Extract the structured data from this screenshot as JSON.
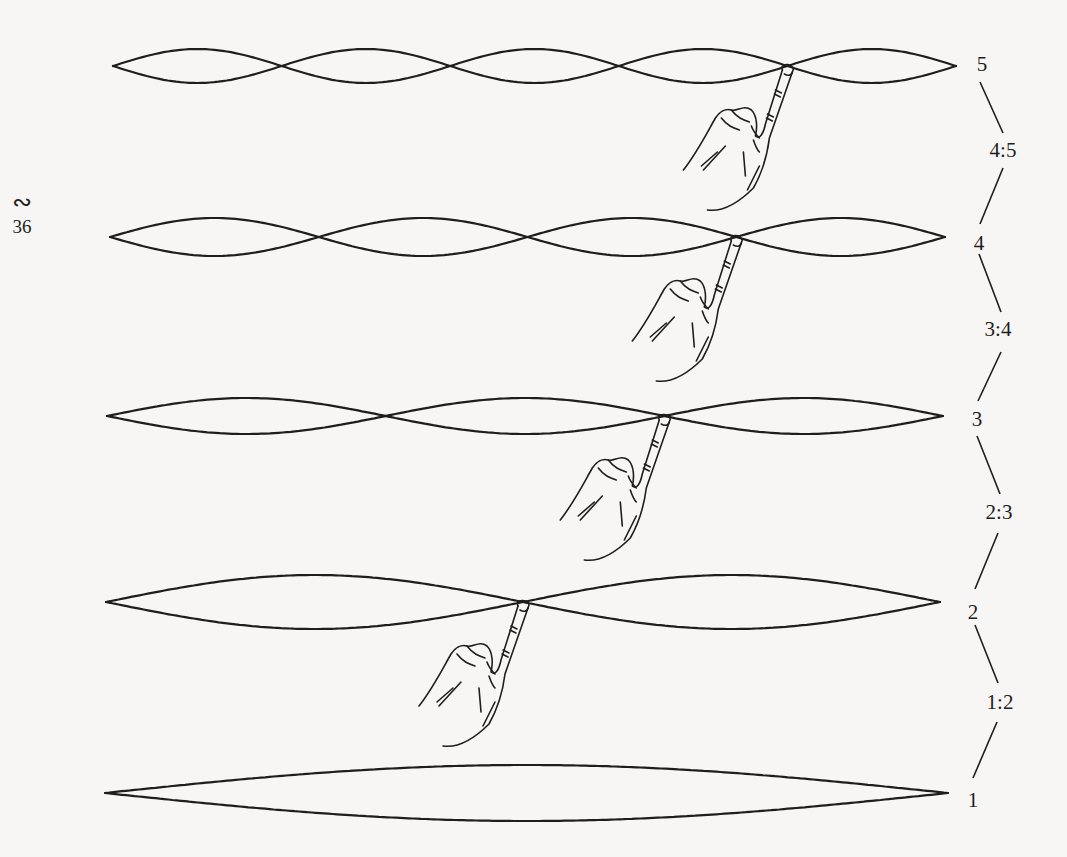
{
  "page": {
    "glyph": "∾",
    "number": "36",
    "background": "#f7f6f4",
    "ink": "#1e1e1e"
  },
  "strings": [
    {
      "harmonic": 5,
      "label": "5",
      "y": 66,
      "x0": 113,
      "x1": 956,
      "amplitude": 17,
      "finger_node": 4
    },
    {
      "harmonic": 4,
      "label": "4",
      "y": 237,
      "x0": 110,
      "x1": 945,
      "amplitude": 19,
      "finger_node": 3
    },
    {
      "harmonic": 3,
      "label": "3",
      "y": 416,
      "x0": 107,
      "x1": 943,
      "amplitude": 18,
      "finger_node": 2
    },
    {
      "harmonic": 2,
      "label": "2",
      "y": 602,
      "x0": 106,
      "x1": 940,
      "amplitude": 27,
      "finger_node": 1
    },
    {
      "harmonic": 1,
      "label": "1",
      "y": 793,
      "x0": 105,
      "x1": 948,
      "amplitude": 28,
      "finger_node": null
    }
  ],
  "ratios": [
    {
      "label": "4:5",
      "x": 1003,
      "y": 150
    },
    {
      "label": "3:4",
      "x": 998,
      "y": 329
    },
    {
      "label": "2:3",
      "x": 999,
      "y": 512
    },
    {
      "label": "1:2",
      "x": 1000,
      "y": 702
    }
  ],
  "number_labels": [
    {
      "label": "5",
      "x": 982,
      "y": 64
    },
    {
      "label": "4",
      "x": 979,
      "y": 243
    },
    {
      "label": "3",
      "x": 977,
      "y": 419
    },
    {
      "label": "2",
      "x": 973,
      "y": 612
    },
    {
      "label": "1",
      "x": 973,
      "y": 800
    }
  ],
  "connectors": [
    [
      980,
      82,
      1003,
      133
    ],
    [
      1003,
      168,
      980,
      224
    ],
    [
      979,
      254,
      1001,
      312
    ],
    [
      1001,
      352,
      978,
      401
    ],
    [
      977,
      436,
      1000,
      494
    ],
    [
      998,
      533,
      975,
      589
    ],
    [
      975,
      625,
      998,
      683
    ],
    [
      997,
      722,
      973,
      778
    ]
  ]
}
